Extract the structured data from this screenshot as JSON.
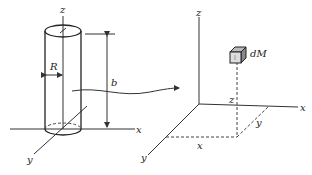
{
  "diagram": {
    "left": {
      "description": "Solid cylinder of radius R and height b standing on the xy-plane",
      "labels": {
        "z_axis": "z",
        "x_axis": "x",
        "y_axis": "y",
        "radius": "R",
        "height": "b"
      }
    },
    "right": {
      "description": "Mass element dM located at coordinates (x, y, z)",
      "labels": {
        "z_axis": "z",
        "x_axis": "x",
        "y_axis": "y",
        "element": "dM",
        "coord_x": "x",
        "coord_y": "y",
        "coord_z": "z"
      }
    },
    "connector": "curved arrow from cylinder to mass element diagram"
  }
}
